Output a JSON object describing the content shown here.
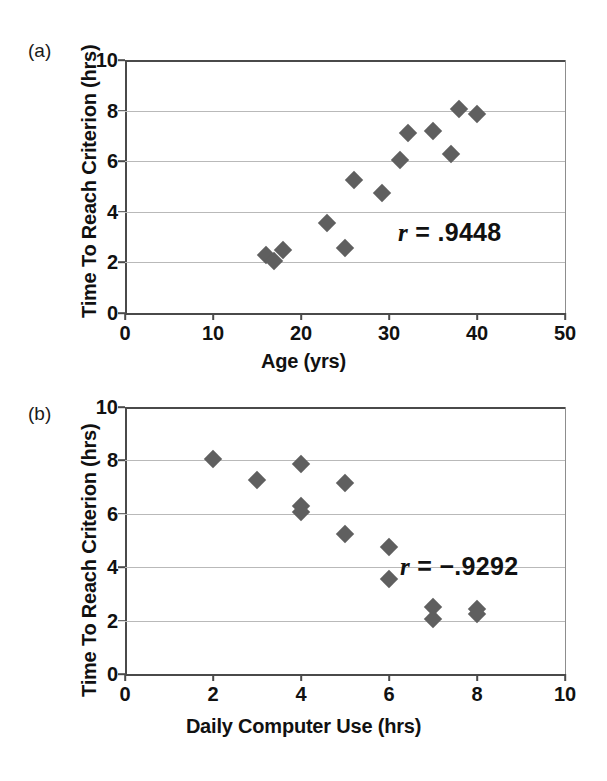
{
  "figure": {
    "panels": [
      {
        "id": "a",
        "label": "(a)",
        "annotation_r_symbol": "r",
        "annotation_r_value": "= .9448"
      },
      {
        "id": "b",
        "label": "(b)",
        "annotation_r_symbol": "r",
        "annotation_r_value": "= −.9292"
      }
    ],
    "marker_color": "#5f5f5f",
    "gridline_color": "#b9b9b9",
    "axis_color": "#4a4a4a"
  },
  "chart_data": [
    {
      "type": "scatter",
      "panel": "a",
      "title": "",
      "xlabel": "Age (yrs)",
      "ylabel": "Time To Reach Criterion (hrs)",
      "xlim": [
        0,
        50
      ],
      "ylim": [
        0,
        10
      ],
      "xticks": [
        0,
        10,
        20,
        30,
        40,
        50
      ],
      "yticks": [
        0,
        2,
        4,
        6,
        8,
        10
      ],
      "grid": true,
      "legend": "none",
      "annotation": "r = .9448",
      "correlation": 0.9448,
      "points": [
        {
          "x": 16.0,
          "y": 2.3
        },
        {
          "x": 16.9,
          "y": 2.05
        },
        {
          "x": 18.0,
          "y": 2.48
        },
        {
          "x": 23.0,
          "y": 3.55
        },
        {
          "x": 25.0,
          "y": 2.58
        },
        {
          "x": 26.0,
          "y": 5.25
        },
        {
          "x": 29.2,
          "y": 4.75
        },
        {
          "x": 31.2,
          "y": 6.05
        },
        {
          "x": 32.2,
          "y": 7.12
        },
        {
          "x": 35.0,
          "y": 7.2
        },
        {
          "x": 37.0,
          "y": 6.28
        },
        {
          "x": 38.0,
          "y": 8.05
        },
        {
          "x": 40.0,
          "y": 7.85
        }
      ]
    },
    {
      "type": "scatter",
      "panel": "b",
      "title": "",
      "xlabel": "Daily Computer Use (hrs)",
      "ylabel": "Time To Reach Criterion (hrs)",
      "xlim": [
        0,
        10
      ],
      "ylim": [
        0,
        10
      ],
      "xticks": [
        0,
        2,
        4,
        6,
        8,
        10
      ],
      "yticks": [
        0,
        2,
        4,
        6,
        8,
        10
      ],
      "grid": true,
      "legend": "none",
      "annotation": "r = −.9292",
      "correlation": -0.9292,
      "points": [
        {
          "x": 2.0,
          "y": 8.05
        },
        {
          "x": 3.0,
          "y": 7.25
        },
        {
          "x": 4.0,
          "y": 7.85
        },
        {
          "x": 4.0,
          "y": 6.3
        },
        {
          "x": 4.0,
          "y": 6.05
        },
        {
          "x": 5.0,
          "y": 7.15
        },
        {
          "x": 5.0,
          "y": 5.25
        },
        {
          "x": 6.0,
          "y": 4.75
        },
        {
          "x": 6.0,
          "y": 3.55
        },
        {
          "x": 7.0,
          "y": 2.5
        },
        {
          "x": 7.0,
          "y": 2.05
        },
        {
          "x": 8.0,
          "y": 2.45
        },
        {
          "x": 8.0,
          "y": 2.25
        }
      ]
    }
  ]
}
